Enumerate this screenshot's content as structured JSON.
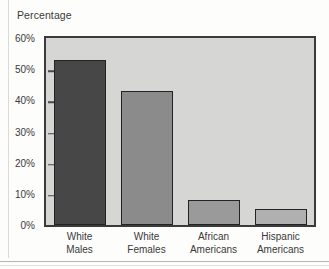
{
  "chart_data": {
    "type": "bar",
    "title": "Percentage",
    "xlabel": "",
    "ylabel": "",
    "ylim": [
      0,
      60
    ],
    "grid": false,
    "legend": "none",
    "y_ticks": [
      "0%",
      "10%",
      "20%",
      "30%",
      "40%",
      "50%",
      "60%"
    ],
    "y_tick_values": [
      0,
      10,
      20,
      30,
      40,
      50,
      60
    ],
    "categories": [
      "White Males",
      "White Females",
      "African Americans",
      "Hispanic Americans"
    ],
    "category_lines": [
      [
        "White",
        "Males"
      ],
      [
        "White",
        "Females"
      ],
      [
        "African",
        "Americans"
      ],
      [
        "Hispanic",
        "Americans"
      ]
    ],
    "values": [
      53,
      43,
      8,
      5
    ],
    "bar_colors": [
      "#474747",
      "#8b8b8b",
      "#9a9a9a",
      "#b0b0b0"
    ],
    "plot_background": "#d6d6d4",
    "plot_border_color": "#3b3b3b",
    "bar_outline_color": "#232323",
    "text_color": "#3a3a3a"
  }
}
